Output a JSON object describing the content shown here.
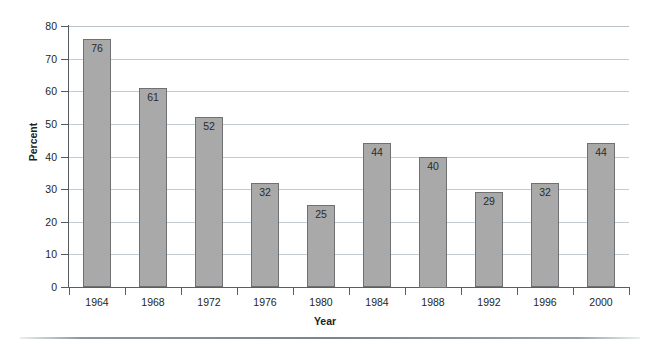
{
  "chart_data": {
    "type": "bar",
    "title": "",
    "xlabel": "Year",
    "ylabel": "Percent",
    "categories": [
      "1964",
      "1968",
      "1972",
      "1976",
      "1980",
      "1984",
      "1988",
      "1992",
      "1996",
      "2000"
    ],
    "values": [
      76,
      61,
      52,
      32,
      25,
      44,
      40,
      29,
      32,
      44
    ],
    "value_labels": [
      "76",
      "61",
      "52",
      "32",
      "25",
      "44",
      "40",
      "29",
      "32",
      "44"
    ],
    "ylim": [
      0,
      80
    ],
    "ytick_labels": [
      "0",
      "10",
      "20",
      "30",
      "40",
      "50",
      "60",
      "70",
      "80"
    ],
    "ytick_values": [
      0,
      10,
      20,
      30,
      40,
      50,
      60,
      70,
      80
    ],
    "grid": "horizontal",
    "legend": "none",
    "colors": {
      "bar_fill": "#a9a9a9",
      "bar_border": "#6f7073",
      "gridline": "#c2cbd4",
      "axis": "#555a5e",
      "text": "#231f20",
      "rule": "#7d8489"
    }
  }
}
